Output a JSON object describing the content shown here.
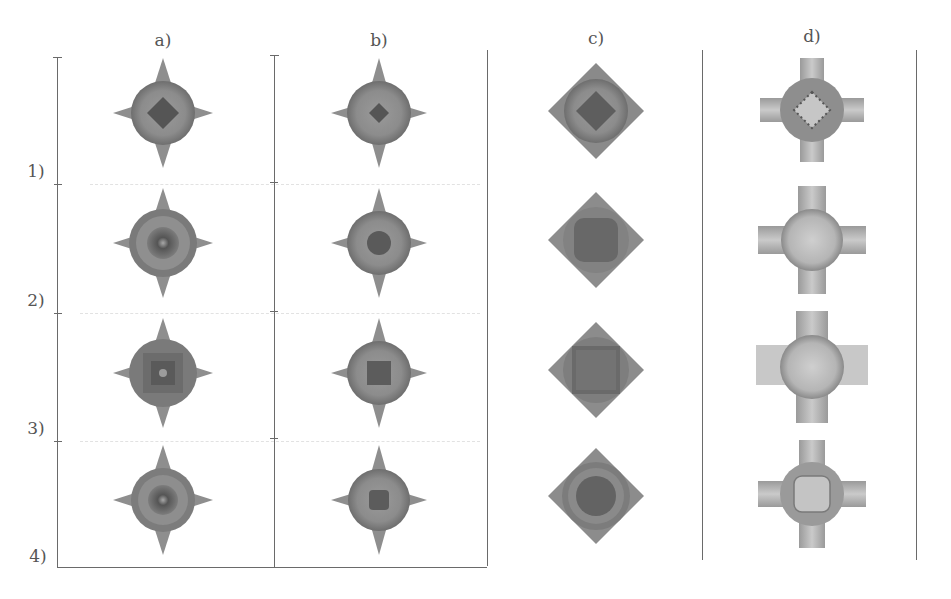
{
  "figure": {
    "column_labels": [
      "a)",
      "b)",
      "c)",
      "d)"
    ],
    "row_labels": [
      "1)",
      "2)",
      "3)",
      "4)"
    ],
    "colors": {
      "axis": "#6a6a6a",
      "shape_dark": "#5a5a5a",
      "shape_mid": "#8a8a8a",
      "shape_light": "#b4b4b4",
      "background": "#ffffff"
    },
    "columns": [
      {
        "label": "a)",
        "shape": "sphere-with-four-spikes",
        "rows": [
          {
            "row": "1)",
            "center": "dark-diamond"
          },
          {
            "row": "2)",
            "center": "ringed-dark-core"
          },
          {
            "row": "3)",
            "center": "square-ringed-core"
          },
          {
            "row": "4)",
            "center": "ringed-dark-core"
          }
        ]
      },
      {
        "label": "b)",
        "shape": "sphere-with-four-spikes",
        "rows": [
          {
            "row": "1)",
            "center": "small-dark-diamond"
          },
          {
            "row": "2)",
            "center": "dark-core"
          },
          {
            "row": "3)",
            "center": "dark-square-core"
          },
          {
            "row": "4)",
            "center": "dark-core"
          }
        ]
      },
      {
        "label": "c)",
        "shape": "octahedron-with-sphere",
        "rows": [
          {
            "row": "1)",
            "center": "dark-diamond"
          },
          {
            "row": "2)",
            "center": "dark-rounded-square"
          },
          {
            "row": "3)",
            "center": "dark-square"
          },
          {
            "row": "4)",
            "center": "dark-disk"
          }
        ]
      },
      {
        "label": "d)",
        "shape": "sphere-with-four-cylinders",
        "rows": [
          {
            "row": "1)",
            "center": "dotted-ring"
          },
          {
            "row": "2)",
            "center": "plain-sphere"
          },
          {
            "row": "3)",
            "center": "plain-sphere"
          },
          {
            "row": "4)",
            "center": "faint-ring"
          }
        ]
      }
    ],
    "caption_fragment": "... ... ..."
  }
}
